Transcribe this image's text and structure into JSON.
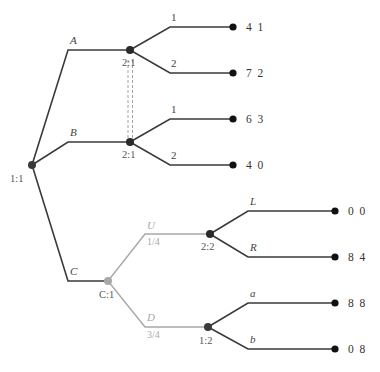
{
  "diagram": {
    "type": "extensive-form game tree",
    "nodes": {
      "root": {
        "label": "1:1",
        "player": "1",
        "x": 32,
        "y": 165
      },
      "p2_top": {
        "label": "2:1",
        "player": "2",
        "x": 130,
        "y": 50
      },
      "p2_bottom": {
        "label": "2:1",
        "player": "2",
        "x": 130,
        "y": 142
      },
      "chance": {
        "label": "C:1",
        "player": "chance",
        "x": 108,
        "y": 281
      },
      "p2_second": {
        "label": "2:2",
        "player": "2",
        "x": 210,
        "y": 234
      },
      "p1_second": {
        "label": "1:2",
        "player": "1",
        "x": 208,
        "y": 327
      }
    },
    "moves": {
      "A": "A",
      "B": "B",
      "C": "C",
      "top_1": "1",
      "top_2": "2",
      "bottom_1": "1",
      "bottom_2": "2",
      "U": "U",
      "D": "D",
      "L": "L",
      "R": "R",
      "a": "a",
      "b": "b"
    },
    "probabilities": {
      "U": "1/4",
      "D": "3/4"
    },
    "payoffs": {
      "A1": "4  1",
      "A2": "7  2",
      "B1": "6  3",
      "B2": "4  0",
      "UL": "0  0",
      "UR": "8  4",
      "Da": "8  8",
      "Db": "0  8"
    },
    "information_sets": [
      {
        "player": "2",
        "label": "2:1",
        "members": [
          "p2_top",
          "p2_bottom"
        ]
      }
    ],
    "colors": {
      "edge": "#3a3a3a",
      "chance": "#a8a8a8",
      "text": "#444444"
    }
  }
}
